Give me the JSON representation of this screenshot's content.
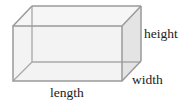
{
  "figure": {
    "type": "rectangular-prism",
    "labels": {
      "height": "height",
      "width": "width",
      "length": "length"
    },
    "colors": {
      "edge": "#9a9a9a",
      "front_face": "#f3f3f3",
      "top_face": "#f6f6f6",
      "side_face": "#e2e2e2",
      "text": "#222222"
    }
  }
}
